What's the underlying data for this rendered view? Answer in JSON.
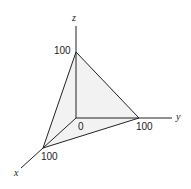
{
  "diagram": {
    "type": "3d-axes-plane",
    "axes": {
      "x": "x",
      "y": "y",
      "z": "z"
    },
    "origin_label": "0",
    "intercepts": {
      "x": "100",
      "y": "100",
      "z": "100"
    },
    "colors": {
      "line": "#222222",
      "fill": "#f2f2f2"
    }
  }
}
